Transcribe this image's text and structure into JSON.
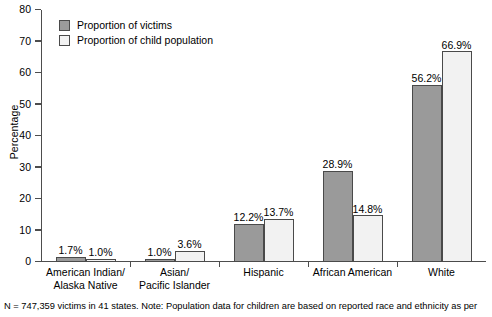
{
  "chart_data": {
    "type": "bar",
    "title": "",
    "subtitle": "",
    "xlabel": "",
    "ylabel": "Percentage",
    "ylim": [
      0,
      80
    ],
    "yticks": [
      0,
      10,
      20,
      30,
      40,
      50,
      60,
      70,
      80
    ],
    "ytick_labels": [
      "0",
      "10",
      "20",
      "30",
      "40",
      "50",
      "60",
      "70",
      "80"
    ],
    "grid": false,
    "legend_position": "top-left",
    "categories": [
      "American Indian/ Alaska Native",
      "Asian/ Pacific Islander",
      "Hispanic",
      "African American",
      "White"
    ],
    "category_lines": [
      [
        "American Indian/",
        "Alaska Native"
      ],
      [
        "Asian/",
        "Pacific Islander"
      ],
      [
        "Hispanic",
        ""
      ],
      [
        "African American",
        ""
      ],
      [
        "White",
        ""
      ]
    ],
    "series": [
      {
        "name": "Proportion of victims",
        "color": "#9a9a9a",
        "values": [
          1.7,
          1.0,
          12.2,
          28.9,
          56.2
        ],
        "labels": [
          "1.7%",
          "1.0%",
          "12.2%",
          "28.9%",
          "56.2%"
        ]
      },
      {
        "name": "Proportion of child population",
        "color": "#f2f2f2",
        "values": [
          1.0,
          3.6,
          13.7,
          14.8,
          66.9
        ],
        "labels": [
          "1.0%",
          "3.6%",
          "13.7%",
          "14.8%",
          "66.9%"
        ]
      }
    ],
    "annotations": [
      "N = 747,359 victims in 41 states. Note: Population data for children are based on reported race and ethnicity as per"
    ]
  },
  "legend": {
    "items": [
      {
        "label": "Proportion of victims"
      },
      {
        "label": "Proportion of child population"
      }
    ]
  },
  "footnote": {
    "text": "N = 747,359 victims in 41 states. Note: Population data for children are based on reported race and ethnicity as per"
  },
  "colors": {
    "series_victims": "#9a9a9a",
    "series_population": "#f2f2f2",
    "axis": "#4d4d4d",
    "bar_border": "#4a4a4a",
    "text": "#000000",
    "background": "#ffffff"
  }
}
